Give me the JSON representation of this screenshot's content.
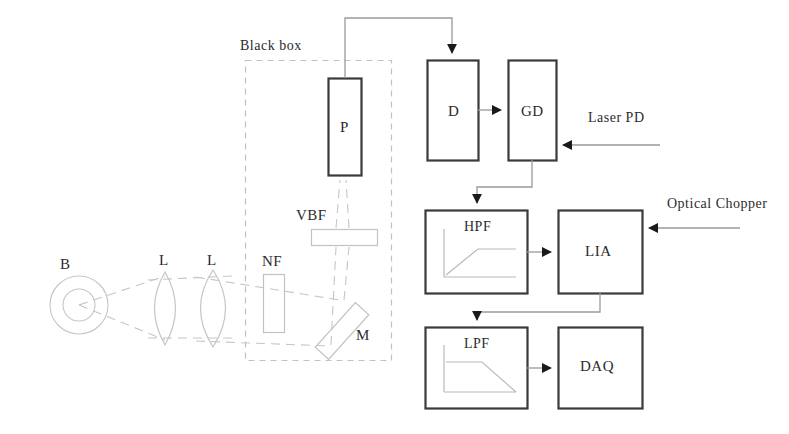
{
  "diagram": {
    "colors": {
      "block_stroke": "#3a3a3a",
      "optics_stroke": "#b9b9b9",
      "wire": "#9a9a9a",
      "arrow_fill": "#1a1a1a",
      "dashed_box": "#bdbdbd",
      "text": "#2b2b2b",
      "background": "#ffffff"
    },
    "enclosure": {
      "label": "Black box"
    },
    "optical_path": {
      "source": {
        "label": "B",
        "name": "blackbody-source"
      },
      "lenses": [
        {
          "label": "L",
          "name": "lens-1"
        },
        {
          "label": "L",
          "name": "lens-2"
        }
      ],
      "filters": [
        {
          "label": "NF",
          "name": "neutral-filter"
        },
        {
          "label": "VBF",
          "name": "variable-band-filter"
        }
      ],
      "mirror": {
        "label": "M",
        "name": "mirror"
      },
      "photodetector": {
        "label": "P",
        "name": "detector-p"
      }
    },
    "electronics": [
      {
        "label": "D",
        "name": "block-d"
      },
      {
        "label": "GD",
        "name": "block-gd"
      },
      {
        "label": "HPF",
        "name": "block-hpf",
        "response": "high-pass"
      },
      {
        "label": "LIA",
        "name": "block-lia"
      },
      {
        "label": "LPF",
        "name": "block-lpf",
        "response": "low-pass"
      },
      {
        "label": "DAQ",
        "name": "block-daq"
      }
    ],
    "external_inputs": [
      {
        "label": "Laser PD",
        "name": "laser-pd-input",
        "target": "GD"
      },
      {
        "label": "Optical Chopper",
        "name": "optical-chopper-input",
        "target": "LIA"
      }
    ]
  }
}
